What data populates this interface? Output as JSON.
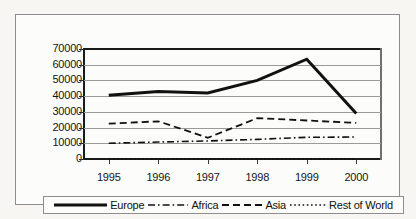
{
  "chart_data": {
    "type": "line",
    "title": "",
    "subtitle": "",
    "xlabel": "",
    "ylabel": "",
    "categories": [
      "1995",
      "1996",
      "1997",
      "1998",
      "1999",
      "2000"
    ],
    "x": [
      1995,
      1996,
      1997,
      1998,
      1999,
      2000
    ],
    "ylim": [
      0,
      70000
    ],
    "yticks": [
      0,
      10000,
      20000,
      30000,
      40000,
      50000,
      60000,
      70000
    ],
    "ytick_labels": [
      "0",
      "10000",
      "20000",
      "30000",
      "40000",
      "50000",
      "60000",
      "70000"
    ],
    "grid": true,
    "grid_axis": "y",
    "legend_position": "bottom",
    "series": [
      {
        "name": "Europe",
        "style": "solid",
        "width": 3,
        "color": "#111111",
        "values": [
          40500,
          43000,
          42000,
          50000,
          63500,
          29000
        ]
      },
      {
        "name": "Africa",
        "style": "dashdot",
        "width": 1.6,
        "color": "#111111",
        "values": [
          10000,
          10800,
          11500,
          12500,
          13800,
          14000
        ]
      },
      {
        "name": "Asia",
        "style": "dashed",
        "width": 1.8,
        "color": "#111111",
        "values": [
          22500,
          24000,
          13500,
          26000,
          24500,
          23000
        ]
      },
      {
        "name": "Rest of World",
        "style": "dotted",
        "width": 1.6,
        "color": "#111111",
        "values": [
          200,
          200,
          200,
          200,
          200,
          200
        ]
      }
    ]
  },
  "legend": {
    "items": [
      {
        "label": "Europe",
        "style": "solid"
      },
      {
        "label": "Africa",
        "style": "dashdot"
      },
      {
        "label": "Asia",
        "style": "dashed"
      },
      {
        "label": "Rest of World",
        "style": "dotted"
      }
    ]
  },
  "colors": {
    "ink": "#111111",
    "grid": "#9a9a9a",
    "frame": "#8d8d8d",
    "background": "#fcfcfa",
    "page": "#f7f6f2"
  }
}
